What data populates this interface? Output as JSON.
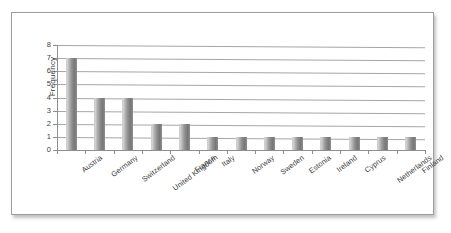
{
  "chart_data": {
    "type": "bar",
    "title": "",
    "xlabel": "",
    "ylabel": "Frequency",
    "ylim": [
      0,
      8
    ],
    "ytick_labels": [
      "8",
      "7",
      "6",
      "5",
      "4",
      "3",
      "2",
      "1",
      "0"
    ],
    "grid": true,
    "legend": false,
    "categories": [
      "Austria",
      "Germany",
      "Switzerland",
      "United Kingdom",
      "France",
      "Italy",
      "Norway",
      "Sweden",
      "Estonia",
      "Ireland",
      "Cyprus",
      "Netherlands",
      "Finland"
    ],
    "values": [
      7,
      4,
      4,
      2,
      2,
      1,
      1,
      1,
      1,
      1,
      1,
      1,
      1
    ],
    "bar_color": "#8f8f8f",
    "gridline_color": "#a6a6a6",
    "axis_color": "#8f8f8f",
    "background_color": "#ffffff",
    "border_color": "#9d9d9d"
  }
}
